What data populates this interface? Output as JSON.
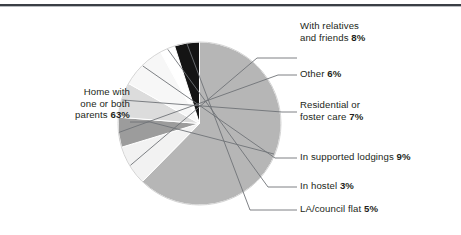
{
  "figure": {
    "name": "living-arrangements-pie-chart",
    "background": "#ffffff",
    "rule_color": "#3a3f45"
  },
  "chart_data": {
    "type": "pie",
    "title": "",
    "xlabel": "",
    "ylabel": "",
    "legend_position": "callout-labels",
    "grid": false,
    "units": "%",
    "total": 101,
    "start_angle_deg": -90,
    "direction": "clockwise",
    "categories": [
      "Home with one or both parents",
      "With relatives and friends",
      "Other",
      "Residential or foster care",
      "In supported lodgings",
      "In hostel",
      "LA/council flat"
    ],
    "values": [
      63,
      8,
      6,
      7,
      9,
      3,
      5
    ],
    "colors": [
      "#b6b6b6",
      "#f2f2f2",
      "#9c9c9c",
      "#dcdcdc",
      "#f7f7f7",
      "#ffffff",
      "#141414"
    ],
    "slices": [
      {
        "label_line1": "Home with",
        "label_line2": "one or both",
        "label_line3": "parents",
        "value_text": "63%",
        "value": 63,
        "color": "#b6b6b6"
      },
      {
        "label_line1": "With relatives",
        "label_line2": "and friends",
        "value_text": "8%",
        "value": 8,
        "color": "#f2f2f2"
      },
      {
        "label_line1": "Other",
        "value_text": "6%",
        "value": 6,
        "color": "#9c9c9c"
      },
      {
        "label_line1": "Residential or",
        "label_line2": "foster care",
        "value_text": "7%",
        "value": 7,
        "color": "#dcdcdc"
      },
      {
        "label_line1": "In supported lodgings",
        "value_text": "9%",
        "value": 9,
        "color": "#f7f7f7"
      },
      {
        "label_line1": "In hostel",
        "value_text": "3%",
        "value": 3,
        "color": "#ffffff"
      },
      {
        "label_line1": "LA/council flat",
        "value_text": "5%",
        "value": 5,
        "color": "#141414"
      }
    ]
  }
}
